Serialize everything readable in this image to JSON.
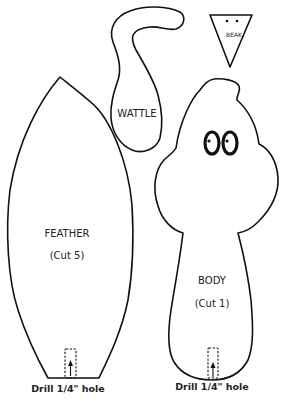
{
  "colors": {
    "line": "#111111",
    "text": "#222222",
    "background": "#ffffff"
  },
  "pieces": {
    "beak": {
      "label": "BEAK"
    },
    "wattle": {
      "label": "WATTLE"
    },
    "feather": {
      "label": "FEATHER",
      "cut": "(Cut 5)",
      "drill_note": "Drill 1/4\" hole"
    },
    "body": {
      "label": "BODY",
      "cut": "(Cut 1)",
      "drill_note": "Drill 1/4\" hole"
    }
  }
}
